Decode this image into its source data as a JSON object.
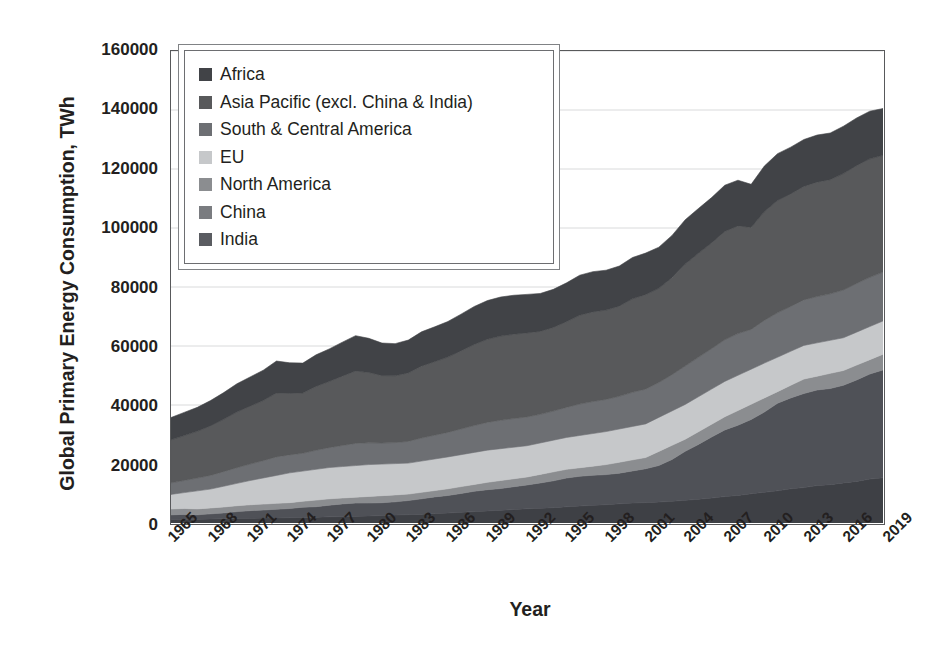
{
  "chart_data": {
    "type": "area",
    "stacked": true,
    "title": "",
    "xlabel": "Year",
    "ylabel": "Global Primary Energy Consumption, TWh",
    "ylim": [
      0,
      160000
    ],
    "ytick_values": [
      0,
      20000,
      40000,
      60000,
      80000,
      100000,
      120000,
      140000,
      160000
    ],
    "ytick_labels": [
      "0",
      "20000",
      "40000",
      "60000",
      "80000",
      "100000",
      "120000",
      "140000",
      "160000"
    ],
    "xlim": [
      1965,
      2019
    ],
    "xtick_labels": [
      "1965",
      "1968",
      "1971",
      "1974",
      "1977",
      "1980",
      "1983",
      "1986",
      "1989",
      "1992",
      "1995",
      "1998",
      "2001",
      "2004",
      "2007",
      "2010",
      "2013",
      "2016",
      "2019"
    ],
    "grid": "horizontal",
    "legend_position": "upper-left",
    "x": [
      1965,
      1966,
      1967,
      1968,
      1969,
      1970,
      1971,
      1972,
      1973,
      1974,
      1975,
      1976,
      1977,
      1978,
      1979,
      1980,
      1981,
      1982,
      1983,
      1984,
      1985,
      1986,
      1987,
      1988,
      1989,
      1990,
      1991,
      1992,
      1993,
      1994,
      1995,
      1996,
      1997,
      1998,
      1999,
      2000,
      2001,
      2002,
      2003,
      2004,
      2005,
      2006,
      2007,
      2008,
      2009,
      2010,
      2011,
      2012,
      2013,
      2014,
      2015,
      2016,
      2017,
      2018,
      2019
    ],
    "series": [
      {
        "name": "India",
        "color": "#3e4045",
        "values": [
          1150,
          1220,
          1280,
          1350,
          1430,
          1510,
          1580,
          1660,
          1720,
          1800,
          1880,
          1980,
          2080,
          2180,
          2300,
          2380,
          2520,
          2680,
          2820,
          3000,
          3200,
          3380,
          3620,
          3860,
          4100,
          4320,
          4560,
          4800,
          4980,
          5200,
          5500,
          5750,
          6000,
          6200,
          6500,
          6750,
          6900,
          7100,
          7350,
          7700,
          8050,
          8450,
          8950,
          9350,
          9900,
          10400,
          10900,
          11600,
          12000,
          12700,
          13000,
          13600,
          14100,
          14900,
          15300
        ]
      },
      {
        "name": "China",
        "color": "#4f5157",
        "values": [
          1600,
          1700,
          1500,
          1750,
          2000,
          2350,
          2600,
          2750,
          2950,
          3100,
          3500,
          3550,
          3950,
          4300,
          4450,
          4400,
          4350,
          4500,
          4800,
          5200,
          5650,
          5950,
          6400,
          6900,
          7200,
          7350,
          7750,
          8100,
          8600,
          9100,
          9750,
          10100,
          10200,
          10200,
          10400,
          10900,
          11500,
          12400,
          14200,
          16600,
          18600,
          20700,
          22600,
          23800,
          25200,
          27200,
          29700,
          30800,
          31900,
          32400,
          32600,
          33100,
          34400,
          35600,
          36600
        ]
      },
      {
        "name": "North America",
        "color": "#8b8d90"
      },
      {
        "name": "EU",
        "color": "#c6c8ca"
      },
      {
        "name": "South & Central America",
        "color": "#6d6f73"
      },
      {
        "name": "Asia Pacific (excl. China & India)",
        "color": "#58595b"
      },
      {
        "name": "Africa",
        "color": "#414347"
      }
    ],
    "cumulative_totals_note": "Stacked order bottom to top: India, China, North America, EU, South & Central America, Asia Pacific (excl. China & India), Africa",
    "stack_boundaries": {
      "years": [
        1965,
        1968,
        1971,
        1974,
        1977,
        1980,
        1983,
        1986,
        1989,
        1992,
        1995,
        1998,
        2001,
        2004,
        2007,
        2010,
        2013,
        2016,
        2019
      ],
      "india": [
        1150,
        1350,
        1580,
        1800,
        2080,
        2380,
        2820,
        3380,
        4100,
        4800,
        5500,
        6200,
        6900,
        7700,
        8950,
        10400,
        12000,
        13600,
        15300
      ],
      "china": [
        2750,
        3100,
        4180,
        4900,
        6030,
        6780,
        7620,
        9330,
        11300,
        12900,
        15250,
        16400,
        18400,
        24300,
        31550,
        37600,
        43900,
        46700,
        51900
      ],
      "north_america": [
        4200,
        4650,
        5900,
        6900,
        8200,
        9000,
        9800,
        11600,
        13800,
        15600,
        18200,
        19800,
        22200,
        28400,
        36000,
        42400,
        48800,
        51700,
        57200
      ],
      "eu": [
        9700,
        11500,
        14400,
        17000,
        18800,
        19800,
        20300,
        22400,
        24700,
        26200,
        29000,
        31000,
        33600,
        40200,
        48000,
        54200,
        60200,
        62800,
        68500
      ]
    },
    "band_values_2019": {
      "India": 15300,
      "China": 36600,
      "North America": 29000,
      "EU": 19700,
      "South & Central America": 9500,
      "Asia Pacific (excl. China & India)": 22000,
      "Africa": 8400,
      "total": 140500
    },
    "band_values_1965": {
      "India": 1150,
      "China": 1600,
      "North America": 14300,
      "EU": 12500,
      "South & Central America": 1500,
      "Asia Pacific (excl. China & India)": 3800,
      "Africa": 900,
      "total": 35750
    },
    "totals": [
      35750,
      37500,
      39200,
      41500,
      44200,
      47200,
      49500,
      51800,
      54900,
      54300,
      54200,
      57000,
      59000,
      61300,
      63500,
      62600,
      61000,
      60800,
      62000,
      64800,
      66500,
      68300,
      70800,
      73400,
      75400,
      76600,
      77200,
      77500,
      77800,
      79200,
      81400,
      84000,
      85200,
      85700,
      87100,
      90000,
      91500,
      93500,
      97500,
      102800,
      106600,
      110300,
      114500,
      116200,
      114800,
      121000,
      125200,
      127400,
      130000,
      131500,
      132200,
      134500,
      137300,
      139600,
      140500
    ]
  },
  "legend": {
    "items": [
      {
        "label": "Africa",
        "color": "#414347"
      },
      {
        "label": "Asia Pacific (excl. China & India)",
        "color": "#58595b"
      },
      {
        "label": "South & Central America",
        "color": "#6d6f73"
      },
      {
        "label": "EU",
        "color": "#c6c8ca"
      },
      {
        "label": "North America",
        "color": "#8b8d90"
      },
      {
        "label": "China",
        "color": "#7a7c80"
      },
      {
        "label": "India",
        "color": "#5a5c61"
      }
    ]
  },
  "axes": {
    "y_title": "Global Primary Energy Consumption, TWh",
    "x_title": "Year"
  }
}
